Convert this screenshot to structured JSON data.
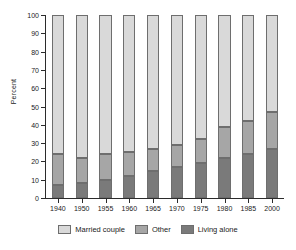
{
  "chart_data": {
    "type": "bar",
    "stacked": true,
    "title": "",
    "xlabel": "",
    "ylabel": "Percent",
    "ylim": [
      0,
      100
    ],
    "ytick_step": 10,
    "yticks": [
      0,
      10,
      20,
      30,
      40,
      50,
      60,
      70,
      80,
      90,
      100
    ],
    "grid": false,
    "legend_position": "bottom",
    "categories": [
      "1940",
      "1950",
      "1955",
      "1960",
      "1965",
      "1970",
      "1975",
      "1980",
      "1985",
      "2000"
    ],
    "series": [
      {
        "name": "Living alone",
        "color": "#7a7a7a",
        "values": [
          7,
          8,
          10,
          12,
          15,
          17,
          19,
          22,
          24,
          27
        ]
      },
      {
        "name": "Other",
        "color": "#a6a6a6",
        "values": [
          17,
          14,
          14,
          13,
          12,
          12,
          13,
          17,
          18,
          20
        ]
      },
      {
        "name": "Married couple",
        "color": "#d9d9d9",
        "values": [
          76,
          78,
          76,
          75,
          73,
          71,
          68,
          61,
          58,
          53
        ]
      }
    ],
    "cumulative_tops": {
      "living_alone": [
        7,
        8,
        10,
        12,
        15,
        17,
        19,
        22,
        24,
        27
      ],
      "other": [
        24,
        22,
        24,
        25,
        27,
        29,
        32,
        39,
        42,
        47
      ],
      "married_couple": [
        100,
        100,
        100,
        100,
        100,
        100,
        100,
        100,
        100,
        100
      ]
    }
  },
  "legend": {
    "items": [
      {
        "label": "Married couple",
        "color": "#d9d9d9"
      },
      {
        "label": "Other",
        "color": "#a6a6a6"
      },
      {
        "label": "Living alone",
        "color": "#7a7a7a"
      }
    ]
  }
}
